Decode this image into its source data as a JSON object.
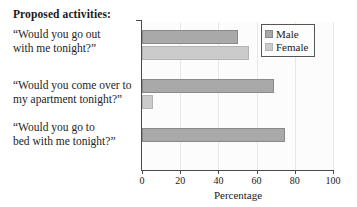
{
  "heading": "Proposed activities:",
  "legend": {
    "position": "top-right",
    "entries": [
      {
        "label": "Male",
        "swatch": "male-swatch",
        "color": "#a9a9a9"
      },
      {
        "label": "Female",
        "swatch": "female-swatch",
        "color": "#cbcbcb"
      }
    ]
  },
  "chart_data": {
    "type": "bar",
    "orientation": "horizontal",
    "title": "",
    "xlabel": "Percentage",
    "ylabel": "",
    "xlim": [
      0,
      100
    ],
    "ticks": [
      0,
      20,
      40,
      60,
      80,
      100
    ],
    "tick_labels": [
      "0",
      "20",
      "40",
      "60",
      "80",
      "100"
    ],
    "grid": true,
    "categories": [
      "“Would you go out with me tonight?”",
      "“Would you come over to my apartment tonight?”",
      "“Would you go to bed with me tonight?”"
    ],
    "category_lines": [
      [
        "“Would you go out",
        "with me tonight?”"
      ],
      [
        "“Would you come over to",
        "my apartment tonight?”"
      ],
      [
        "“Would you go to",
        "bed with me tonight?”"
      ]
    ],
    "series": [
      {
        "name": "Male",
        "color": "#a9a9a9",
        "values": [
          50,
          69,
          75
        ]
      },
      {
        "name": "Female",
        "color": "#cbcbcb",
        "values": [
          56,
          6,
          0
        ]
      }
    ]
  }
}
